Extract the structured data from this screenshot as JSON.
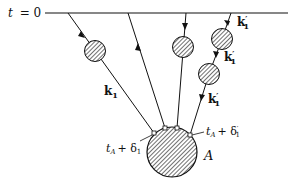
{
  "diagram": {
    "time_axis": {
      "label_t": "t",
      "label_eq": "= 0"
    },
    "particles": {
      "k1": {
        "label": "k",
        "sub": "1"
      },
      "k1_prime_top": {
        "label": "k",
        "sub": "1",
        "prime": "′"
      },
      "k1_prime_mid": {
        "label": "k",
        "sub": "1",
        "prime": "′"
      },
      "k1_prime_low": {
        "label": "k",
        "sub": "1",
        "prime": "′"
      }
    },
    "vertices": {
      "left": {
        "t": "t",
        "sub_A": "A",
        "plus": "+ δ",
        "sub": "1"
      },
      "right": {
        "t": "t",
        "sub_A": "A",
        "plus": "+ δ",
        "sub": "1",
        "prime": "′"
      }
    },
    "source": {
      "label": "A"
    },
    "colors": {
      "ink": "#111111",
      "fill": "#bbbbbb",
      "background": "#ffffff"
    }
  }
}
